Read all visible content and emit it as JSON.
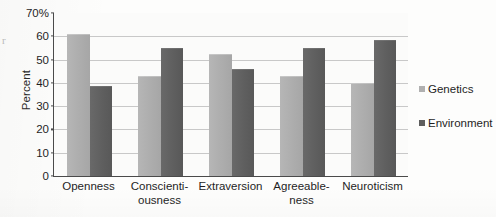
{
  "chart_data": {
    "type": "bar",
    "title": "",
    "xlabel": "",
    "ylabel": "Percent",
    "ylim": [
      0,
      70
    ],
    "ytick_values": [
      70,
      60,
      50,
      40,
      30,
      20,
      10,
      0
    ],
    "ytick_labels": [
      "70%",
      "60",
      "50",
      "40",
      "30",
      "20",
      "10",
      "0"
    ],
    "grid": true,
    "legend_position": "right",
    "categories": [
      "Openness",
      "Conscienti-\nousness",
      "Extraversion",
      "Agreeable-\nness",
      "Neuroticism"
    ],
    "category_lines": [
      [
        "Openness"
      ],
      [
        "Conscienti-",
        "ousness"
      ],
      [
        "Extraversion"
      ],
      [
        "Agreeable-",
        "ness"
      ],
      [
        "Neuroticism"
      ]
    ],
    "series": [
      {
        "name": "Genetics",
        "color": "#b0b0b0",
        "values": [
          61,
          43,
          52.5,
          43,
          40
        ]
      },
      {
        "name": "Environment",
        "color": "#5e5e5e",
        "values": [
          38.5,
          55,
          46,
          55,
          58.5
        ]
      }
    ]
  },
  "legend": {
    "items": [
      {
        "label": "Genetics",
        "swatch": "genetics"
      },
      {
        "label": "Environment",
        "swatch": "environment"
      }
    ]
  },
  "artifacts": {
    "scan_mark": "r"
  }
}
